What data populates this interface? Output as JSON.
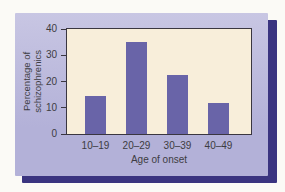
{
  "chart_data": {
    "type": "bar",
    "categories": [
      "10–19",
      "20–29",
      "30–39",
      "40–49"
    ],
    "values": [
      14.5,
      35,
      22.5,
      12
    ],
    "title": "",
    "xlabel": "Age of onset",
    "ylabel": "Percentage of schizophrenics",
    "ylabel_lines": [
      "Percentage of",
      "schizophrenics"
    ],
    "ylim": [
      0,
      40
    ],
    "yticks": [
      0,
      10,
      20,
      30,
      40
    ],
    "grid": false,
    "legend": null,
    "colors": {
      "bar": "#6964a8",
      "plot_background": "#f8eeda",
      "panel_background_top": "#c8c6e3",
      "panel_background_bottom": "#b3b1d8",
      "drop_shadow": "#3a3480",
      "axis_line": "#3a3640",
      "text": "#3d3c42",
      "page_background": "#fbfaf6"
    }
  }
}
